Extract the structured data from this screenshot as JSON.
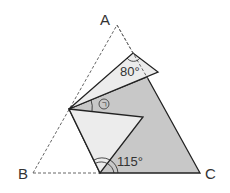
{
  "diagram": {
    "type": "folded-triangle-geometry",
    "vertices": {
      "A": {
        "label": "A",
        "x": 117,
        "y": 25
      },
      "B": {
        "label": "B",
        "x": 33,
        "y": 173
      },
      "C": {
        "label": "C",
        "x": 200,
        "y": 173
      }
    },
    "angles": {
      "top": {
        "label": "80°"
      },
      "bottom": {
        "label": "115°"
      },
      "unknown": {
        "label": "㉠"
      }
    },
    "colors": {
      "dark_fill": "#c8c8c8",
      "light_fill": "#ececec",
      "stroke": "#222222",
      "dashed": "#666666"
    }
  }
}
